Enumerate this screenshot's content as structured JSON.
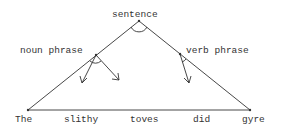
{
  "diagram": {
    "root": {
      "label": "sentence"
    },
    "phrases": [
      {
        "label": "noun phrase"
      },
      {
        "label": "verb phrase"
      }
    ],
    "words": [
      "The",
      "slithy",
      "toves",
      "did",
      "gyre"
    ],
    "colors": {
      "line": "#333333",
      "text": "#333333",
      "background": "#ffffff"
    }
  }
}
